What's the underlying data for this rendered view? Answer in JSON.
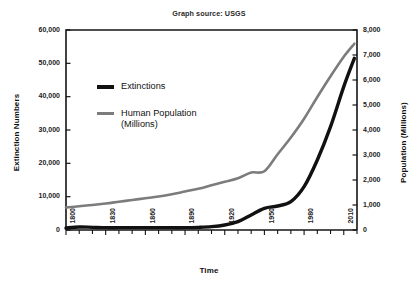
{
  "source_note": "Graph source: USGS",
  "chart_data": {
    "type": "line",
    "title": "Graph source: USGS",
    "xlabel": "Time",
    "ylabel": "Extinction Numbers",
    "y2label": "Population (Millions)",
    "grid": false,
    "legend_position": "upper-left-inside",
    "xlim": [
      1800,
      2020
    ],
    "ylim": [
      0,
      60000
    ],
    "y2lim": [
      0,
      8000
    ],
    "xticks": [
      1800,
      1810,
      1820,
      1830,
      1840,
      1850,
      1860,
      1870,
      1880,
      1890,
      1900,
      1910,
      1920,
      1930,
      1940,
      1950,
      1960,
      1970,
      1980,
      1990,
      2000,
      2010,
      2020
    ],
    "xtick_labels_major": [
      "1800",
      "1830",
      "1860",
      "1890",
      "1920",
      "1950",
      "1980",
      "2010"
    ],
    "xticks_major": [
      1800,
      1830,
      1860,
      1890,
      1920,
      1950,
      1980,
      2010
    ],
    "ytick_labels": [
      "0",
      "10,000",
      "20,000",
      "30,000",
      "40,000",
      "50,000",
      "60,000"
    ],
    "yticks": [
      0,
      10000,
      20000,
      30000,
      40000,
      50000,
      60000
    ],
    "y2tick_labels": [
      "0",
      "1,000",
      "2,000",
      "3,000",
      "4,000",
      "5,000",
      "6,000",
      "7,000",
      "8,000"
    ],
    "y2ticks": [
      0,
      1000,
      2000,
      3000,
      4000,
      5000,
      6000,
      7000,
      8000
    ],
    "series": [
      {
        "name": "Extinctions",
        "axis": "left",
        "color": "#111111",
        "width": 3.4,
        "x": [
          1800,
          1810,
          1820,
          1830,
          1840,
          1850,
          1860,
          1870,
          1880,
          1890,
          1900,
          1910,
          1920,
          1930,
          1940,
          1950,
          1960,
          1970,
          1980,
          1990,
          2000,
          2010,
          2018
        ],
        "values": [
          600,
          900,
          800,
          700,
          700,
          700,
          700,
          700,
          700,
          700,
          800,
          1000,
          1500,
          2500,
          4500,
          6500,
          7200,
          8500,
          13000,
          21000,
          31000,
          43000,
          51500
        ]
      },
      {
        "name": "Human Population (Millions)",
        "axis": "right",
        "color": "#7c7c7c",
        "width": 2.6,
        "x": [
          1800,
          1810,
          1820,
          1830,
          1840,
          1850,
          1860,
          1870,
          1880,
          1890,
          1900,
          1910,
          1920,
          1930,
          1940,
          1950,
          1960,
          1970,
          1980,
          1990,
          2000,
          2010,
          2018
        ],
        "values": [
          900,
          950,
          1000,
          1060,
          1130,
          1200,
          1270,
          1340,
          1430,
          1540,
          1650,
          1790,
          1930,
          2070,
          2300,
          2350,
          3030,
          3700,
          4450,
          5320,
          6150,
          6930,
          7450
        ]
      }
    ],
    "annotations": []
  },
  "legend": [
    {
      "label": "Extinctions",
      "swatch": "thick-black-line"
    },
    {
      "label": "Human Population\n(Millions)",
      "swatch": "gray-line"
    }
  ],
  "axes": {
    "x_title": "Time",
    "y_left_title": "Extinction Numbers",
    "y_right_title": "Population (Millions)"
  }
}
